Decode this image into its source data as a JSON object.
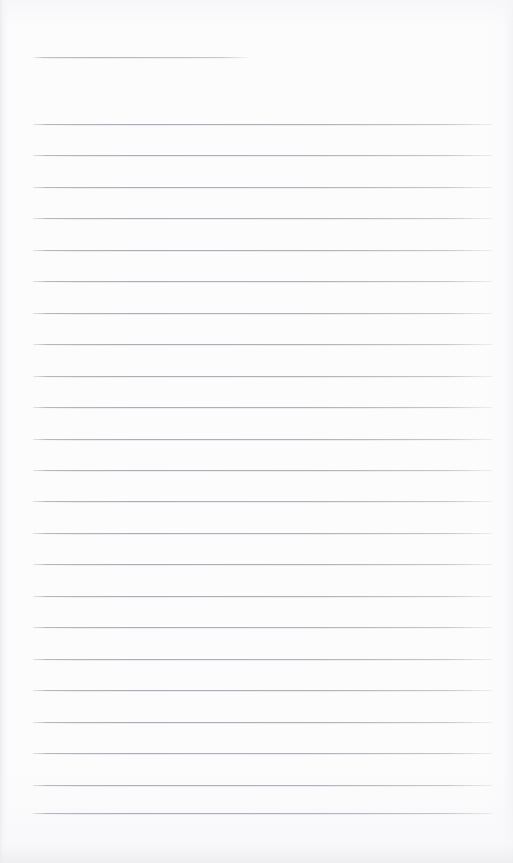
{
  "page": {
    "kind": "scanned-ruled-notebook-page",
    "width": 513,
    "height": 863,
    "background_color": "#fcfcfd",
    "content_text": "",
    "handwriting_text": "",
    "printed_text": ""
  },
  "colors": {
    "paper": "#fcfcfd",
    "rule_line": "#aeb2ba",
    "rule_line_soft": "#d8dadf",
    "edge_shadow": "#e4e5e9"
  },
  "ruling": {
    "left_margin_x": 33,
    "right_margin_x": 492,
    "line_spacing": 31.3,
    "line_thickness": 1,
    "first_full_line_y": 124,
    "last_full_line_y": 813,
    "full_line_count": 23
  },
  "header_rule": {
    "name": "title-rule",
    "x_start": 33,
    "x_end": 248,
    "y": 57,
    "width": 215
  },
  "rules": [
    {
      "y": 124,
      "x": 33,
      "width": 459
    },
    {
      "y": 155,
      "x": 33,
      "width": 459
    },
    {
      "y": 187,
      "x": 33,
      "width": 459
    },
    {
      "y": 218,
      "x": 33,
      "width": 459
    },
    {
      "y": 250,
      "x": 33,
      "width": 459
    },
    {
      "y": 281,
      "x": 33,
      "width": 459
    },
    {
      "y": 313,
      "x": 33,
      "width": 459
    },
    {
      "y": 344,
      "x": 33,
      "width": 459
    },
    {
      "y": 376,
      "x": 33,
      "width": 459
    },
    {
      "y": 407,
      "x": 33,
      "width": 459
    },
    {
      "y": 439,
      "x": 33,
      "width": 459
    },
    {
      "y": 470,
      "x": 33,
      "width": 459
    },
    {
      "y": 501,
      "x": 33,
      "width": 459
    },
    {
      "y": 533,
      "x": 33,
      "width": 459
    },
    {
      "y": 564,
      "x": 33,
      "width": 459
    },
    {
      "y": 596,
      "x": 33,
      "width": 459
    },
    {
      "y": 627,
      "x": 33,
      "width": 459
    },
    {
      "y": 659,
      "x": 33,
      "width": 459
    },
    {
      "y": 690,
      "x": 33,
      "width": 459
    },
    {
      "y": 722,
      "x": 33,
      "width": 459
    },
    {
      "y": 753,
      "x": 33,
      "width": 459
    },
    {
      "y": 785,
      "x": 33,
      "width": 459
    },
    {
      "y": 813,
      "x": 33,
      "width": 459
    }
  ]
}
